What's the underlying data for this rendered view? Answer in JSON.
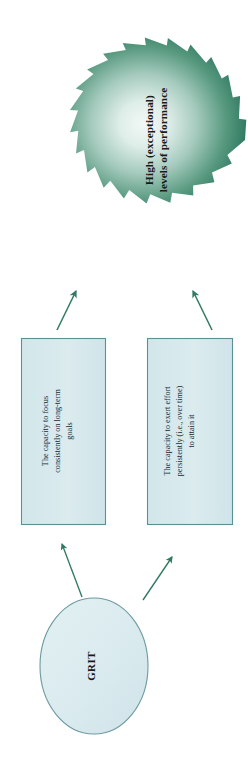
{
  "diagram": {
    "title_text_nodes": {
      "outcome": "High (exceptional)\nlevels of performance",
      "component_one": "The capacity to focus\nconsistently on long-term\ngoals",
      "component_two": "The capacity to exert effort\npersistently (i.e., over time)\nto attain it",
      "source": "GRIT"
    },
    "nodes": [
      {
        "id": "outcome-star",
        "shape": "star-burst",
        "label": "High (exceptional)\nlevels of performance",
        "fill_outer": "#2f7d62",
        "fill_inner": "#eef6f3",
        "text_color": "#1a1a1a"
      },
      {
        "id": "component-box-1",
        "shape": "rectangle",
        "label": "The capacity to focus\nconsistently on long-term\ngoals",
        "fill": "#d7e8ec",
        "stroke": "#5c8f96",
        "text_color": "#20282d"
      },
      {
        "id": "component-box-2",
        "shape": "rectangle",
        "label": "The capacity to exert effort\npersistently (i.e., over time)\nto attain it",
        "fill": "#d7e8ec",
        "stroke": "#5c8f96",
        "text_color": "#20282d"
      },
      {
        "id": "source-ellipse",
        "shape": "ellipse",
        "label": "GRIT",
        "fill": "#dcebee",
        "stroke": "#6b9aa0",
        "text_color": "#1a1a1a"
      }
    ],
    "connectors": [
      {
        "id": "arrow-box1-to-star",
        "from": "component-box-1",
        "to": "outcome-star",
        "color": "#2e7a64",
        "direction": "up-right"
      },
      {
        "id": "arrow-box2-to-star",
        "from": "component-box-2",
        "to": "outcome-star",
        "color": "#2e7a64",
        "direction": "up-left"
      },
      {
        "id": "arrow-ellipse-to-box1",
        "from": "source-ellipse",
        "to": "component-box-1",
        "color": "#2e7a64",
        "direction": "up-right"
      },
      {
        "id": "arrow-ellipse-to-box2",
        "from": "source-ellipse",
        "to": "component-box-2",
        "color": "#2e7a64",
        "direction": "up-right"
      }
    ],
    "colors": {
      "background": "#ffffff",
      "accent_green": "#2f7d62",
      "box_fill": "#d7e8ec",
      "box_stroke": "#5c8f96",
      "ellipse_fill": "#dcebee",
      "ellipse_stroke": "#6b9aa0",
      "arrow": "#2e7a64"
    },
    "orientation": "text-rotated-90-ccw"
  }
}
